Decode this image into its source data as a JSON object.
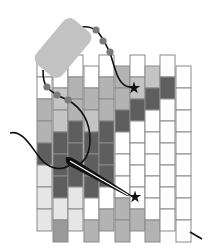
{
  "diagram": {
    "title": "",
    "type": "peyote-stitch-beading-diagram",
    "palette": {
      "white": "#ffffff",
      "very_light": "#e6e6e6",
      "light": "#c4c4c4",
      "mid": "#b3b3b3",
      "mid_dark": "#9a9a9a",
      "dark": "#5e5e5e",
      "outline": "#8a8a8a",
      "thread": "#111111",
      "stop_bead": "#c2c2c2",
      "thread_bead": "#7a7a7a"
    },
    "grid": {
      "columns": 10,
      "column_x": [
        37,
        53,
        68,
        84,
        99,
        115,
        130,
        145,
        160,
        176
      ],
      "column_width": 15,
      "bead_height": 22,
      "even_column_top": 55,
      "odd_column_top": 66,
      "beads_per_column": 8,
      "colors_by_column": [
        [
          "white",
          "white",
          "mid",
          "mid",
          "dark",
          "very_light",
          "very_light",
          "very_light"
        ],
        [
          "white",
          "light",
          "light",
          "dark",
          "dark",
          "dark",
          "very_light",
          "mid_dark"
        ],
        [
          "white",
          "mid",
          "mid",
          "dark",
          "dark",
          "dark",
          "very_light",
          "very_light"
        ],
        [
          "white",
          "mid",
          "light",
          "dark",
          "dark",
          "dark",
          "white",
          "mid"
        ],
        [
          "white",
          "mid",
          "mid",
          "dark",
          "dark",
          "dark",
          "white",
          "mid"
        ],
        [
          "mid",
          "mid",
          "dark",
          "white",
          "white",
          "white",
          "mid",
          "mid"
        ],
        [
          "white",
          "light",
          "dark",
          "white",
          "white",
          "white",
          "white",
          "mid"
        ],
        [
          "light",
          "dark",
          "white",
          "white",
          "white",
          "white",
          "white",
          "mid"
        ],
        [
          "white",
          "dark",
          "white",
          "white",
          "white",
          "white",
          "white",
          "white"
        ],
        [
          "white",
          "white",
          "white",
          "white",
          "white",
          "white",
          "white",
          "white"
        ]
      ]
    },
    "markers": [
      {
        "name": "star-upper",
        "x": 134,
        "y": 88
      },
      {
        "name": "star-lower",
        "x": 135,
        "y": 197
      }
    ],
    "thread_beads": [
      {
        "x": 96,
        "y": 30
      },
      {
        "x": 103,
        "y": 41
      },
      {
        "x": 110,
        "y": 52
      },
      {
        "x": 47,
        "y": 87
      },
      {
        "x": 57,
        "y": 95
      },
      {
        "x": 68,
        "y": 100
      }
    ]
  }
}
